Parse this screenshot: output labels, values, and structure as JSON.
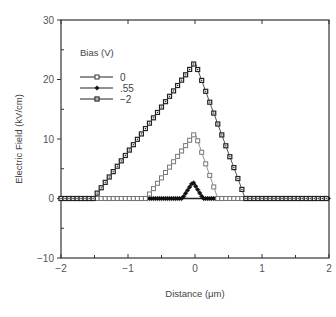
{
  "chart_data": {
    "type": "line",
    "title": "",
    "xlabel": "Distance (μm)",
    "ylabel": "Electric Field (kV/cm)",
    "xlim": [
      -2,
      2
    ],
    "ylim": [
      -10,
      30
    ],
    "x_ticks": [
      -2,
      -1,
      0,
      1,
      2
    ],
    "x_tick_labels": [
      "−2",
      "−1",
      "0",
      "1",
      "2"
    ],
    "x_minor_step": 0.5,
    "y_ticks": [
      -10,
      0,
      10,
      20,
      30
    ],
    "y_tick_labels": [
      "−10",
      "0",
      "10",
      "20",
      "30"
    ],
    "y_minor_step": 5,
    "grid": false,
    "legend": {
      "title": "Bias (V)",
      "position": "upper-left"
    },
    "series": [
      {
        "name": "0",
        "marker": "open-square",
        "color": "#777777",
        "x": [
          -2.0,
          -0.73,
          0.0,
          0.34,
          2.0
        ],
        "y": [
          0,
          0,
          11.0,
          0,
          0
        ]
      },
      {
        "name": ".55",
        "marker": "filled-diamond",
        "color": "#111111",
        "x": [
          -2.0,
          -0.19,
          -0.03,
          0.12,
          2.0
        ],
        "y": [
          0,
          0,
          2.8,
          0,
          0
        ]
      },
      {
        "name": "−2",
        "marker": "dotted-square",
        "color": "#222222",
        "x": [
          -2.0,
          -1.52,
          0.0,
          0.75,
          2.0
        ],
        "y": [
          0,
          0,
          22.9,
          0,
          0
        ]
      }
    ]
  }
}
